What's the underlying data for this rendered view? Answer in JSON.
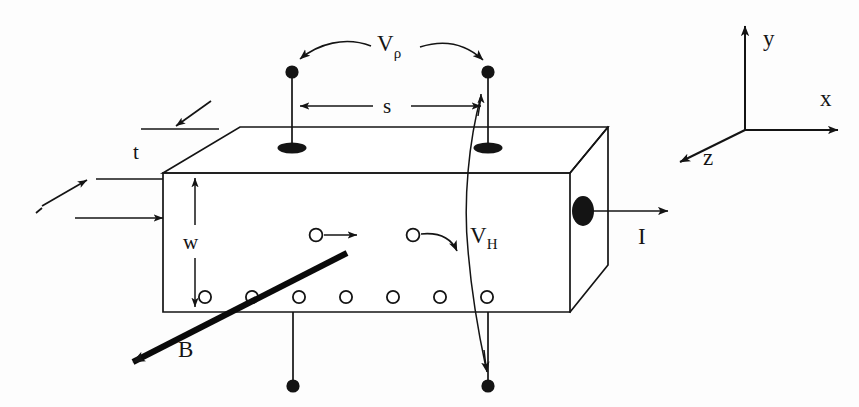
{
  "figure": {
    "background_color": "#ffffff",
    "ink_color": "#141414"
  },
  "labels": {
    "thickness": "t",
    "width": "w",
    "spacing": "s",
    "resistivity_voltage": "V",
    "resistivity_voltage_sub": "ρ",
    "hall_voltage": "V",
    "hall_voltage_sub": "H",
    "current": "I",
    "magnetic_field": "B"
  },
  "axes": {
    "x_label": "x",
    "y_label": "y",
    "z_label": "z",
    "origin_px": [
      745,
      130
    ],
    "x_tip_px": [
      841,
      130
    ],
    "y_tip_px": [
      745,
      23
    ],
    "z_tip_px": [
      676,
      165
    ]
  },
  "sample": {
    "shape": "rectangular-bar",
    "front_face": [
      [
        163,
        173
      ],
      [
        570,
        173
      ],
      [
        570,
        312
      ],
      [
        163,
        312
      ]
    ],
    "top_face": [
      [
        163,
        173
      ],
      [
        240,
        127
      ],
      [
        608,
        127
      ],
      [
        570,
        173
      ]
    ],
    "right_face": [
      [
        570,
        173
      ],
      [
        608,
        127
      ],
      [
        608,
        265
      ],
      [
        570,
        312
      ]
    ]
  },
  "contacts": {
    "top_contacts_px": [
      [
        292,
        148
      ],
      [
        488,
        148
      ]
    ],
    "bottom_contacts_px": [
      [
        293,
        312
      ],
      [
        488,
        312
      ]
    ],
    "top_terminals_px": [
      [
        292,
        72
      ],
      [
        488,
        72
      ]
    ],
    "bottom_terminals_px": [
      [
        293,
        386
      ],
      [
        488,
        386
      ]
    ],
    "current_contact_px": [
      583,
      211
    ]
  },
  "carriers": {
    "count_bottom_row": 7,
    "bottom_row_y_px": 297,
    "bottom_row_x_px": [
      205,
      252,
      299,
      346,
      393,
      440,
      487
    ],
    "drift_carrier_px": [
      316,
      235
    ],
    "deflected_carrier_px": [
      413,
      235
    ]
  },
  "legend": {
    "vrho_description": "resistivity voltage measured across spacing s on the top face",
    "vh_description": "Hall voltage measured between top and bottom faces",
    "current_description": "current I flowing out along +x",
    "bfield_description": "magnetic field B directed along -z"
  }
}
